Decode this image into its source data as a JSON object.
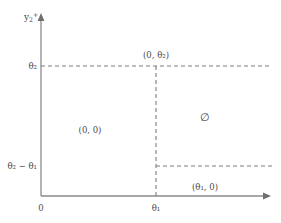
{
  "figure": {
    "width": 281,
    "height": 223,
    "background": "#ffffff",
    "stroke_color": "#808080",
    "text_color": "#4a4a4a"
  },
  "axes": {
    "y_axis_label": "y",
    "y_axis_label_sub": "2",
    "y_axis_label_sup": "+",
    "origin_label": "0",
    "x_origin_px": 41,
    "y_origin_px": 196,
    "x_axis_end_px": 270,
    "y_axis_top_px": 14
  },
  "ticks": {
    "y": [
      {
        "label": "θ",
        "sub": "2",
        "suffix": "",
        "y_px": 66
      },
      {
        "label": "θ",
        "sub": "2",
        "suffix": " − θ",
        "sub2": "1",
        "y_px": 166
      }
    ],
    "x": [
      {
        "label": "θ",
        "sub": "1",
        "x_px": 156
      }
    ]
  },
  "guides": {
    "horizontal": [
      {
        "name": "theta2-line",
        "y_px": 66,
        "x_start_px": 41,
        "x_end_px": 272
      },
      {
        "name": "theta2-minus-theta1-line",
        "y_px": 166,
        "x_start_px": 156,
        "x_end_px": 272
      }
    ],
    "vertical": [
      {
        "name": "theta1-line",
        "x_px": 156,
        "y_start_px": 66,
        "y_end_px": 196
      }
    ]
  },
  "region_labels": [
    {
      "name": "label-0-theta2",
      "text": "(0, θ₂)",
      "x_px": 156,
      "y_px": 55,
      "anchor": "center"
    },
    {
      "name": "label-0-0",
      "text": "(0, 0)",
      "x_px": 90,
      "y_px": 130,
      "anchor": "center"
    },
    {
      "name": "label-empty-set",
      "text": "∅",
      "x_px": 205,
      "y_px": 117,
      "anchor": "center"
    },
    {
      "name": "label-theta1-0",
      "text": "(θ₁, 0)",
      "x_px": 205,
      "y_px": 187,
      "anchor": "center"
    }
  ],
  "tick_label_theta2": "θ₂",
  "tick_label_theta2_minus_theta1": "θ₂ − θ₁",
  "tick_label_theta1": "θ₁",
  "tick_label_origin": "0",
  "axis_label_y": "y₂⁺"
}
